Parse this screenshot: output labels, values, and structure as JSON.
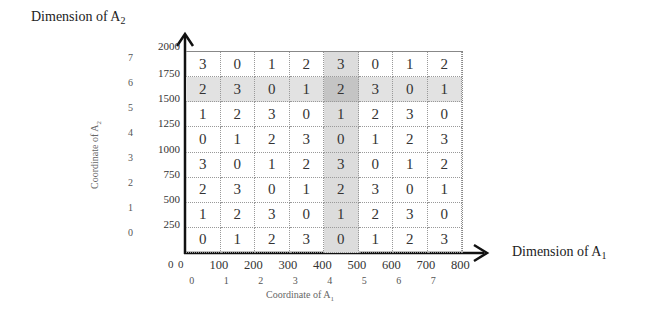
{
  "chart_data": {
    "type": "table",
    "title": "",
    "x_axis": {
      "label": "Dimension of A",
      "label_sub": "1",
      "ticks": [
        "0",
        "100",
        "200",
        "300",
        "400",
        "500",
        "600",
        "700",
        "800"
      ],
      "range": [
        0,
        800
      ],
      "coordinate_label": "Coordinate of A",
      "coordinate_sub": "1",
      "coordinates": [
        "0",
        "1",
        "2",
        "3",
        "4",
        "5",
        "6",
        "7"
      ]
    },
    "y_axis": {
      "label": "Dimension of A",
      "label_sub": "2",
      "ticks": [
        "0",
        "250",
        "500",
        "750",
        "1000",
        "1250",
        "1500",
        "1750",
        "2000"
      ],
      "range": [
        0,
        2000
      ],
      "coordinate_label": "Coordinate of A",
      "coordinate_sub": "2",
      "coordinates": [
        "0",
        "1",
        "2",
        "3",
        "4",
        "5",
        "6",
        "7"
      ]
    },
    "origin_label": "0",
    "grid_rows_top_to_bottom": [
      [
        3,
        0,
        1,
        2,
        3,
        0,
        1,
        2
      ],
      [
        2,
        3,
        0,
        1,
        2,
        3,
        0,
        1
      ],
      [
        1,
        2,
        3,
        0,
        1,
        2,
        3,
        0
      ],
      [
        0,
        1,
        2,
        3,
        0,
        1,
        2,
        3
      ],
      [
        3,
        0,
        1,
        2,
        3,
        0,
        1,
        2
      ],
      [
        2,
        3,
        0,
        1,
        2,
        3,
        0,
        1
      ],
      [
        1,
        2,
        3,
        0,
        1,
        2,
        3,
        0
      ],
      [
        0,
        1,
        2,
        3,
        0,
        1,
        2,
        3
      ]
    ],
    "highlighted_row_coordinate": 6,
    "highlighted_column_coordinate": 4,
    "colors": {
      "row_highlight": "#e2e2e2",
      "col_highlight": "#dcdcdc",
      "intersection": "#c4c4c4"
    }
  }
}
